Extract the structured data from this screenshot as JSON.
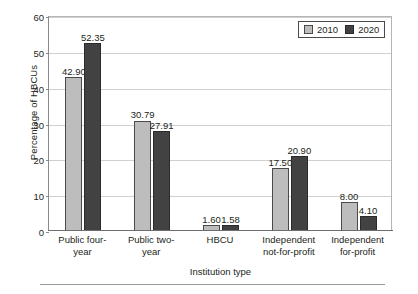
{
  "chart_data": {
    "type": "bar",
    "title": "",
    "xlabel": "Institution type",
    "ylabel": "Percentage of HBCUs",
    "ylim": [
      0,
      60
    ],
    "yticks": [
      0,
      10,
      20,
      30,
      40,
      50,
      60
    ],
    "grid": true,
    "legend_position": "top-right",
    "categories": [
      "Public four-year",
      "Public two-year",
      "HBCU",
      "Independent not-for-profit",
      "Independent for-profit"
    ],
    "category_lines": [
      [
        "Public four-",
        "year"
      ],
      [
        "Public two-",
        "year"
      ],
      [
        "HBCU"
      ],
      [
        "Independent",
        "not-for-profit"
      ],
      [
        "Independent",
        "for-profit"
      ]
    ],
    "series": [
      {
        "name": "2010",
        "color": "#bdbdbd",
        "values": [
          42.9,
          30.79,
          1.6,
          17.5,
          8.0
        ],
        "labels": [
          "42.90",
          "30.79",
          "1.60",
          "17.50",
          "8.00"
        ]
      },
      {
        "name": "2020",
        "color": "#424242",
        "values": [
          52.35,
          27.91,
          1.58,
          20.9,
          4.1
        ],
        "labels": [
          "52.35",
          "27.91",
          "1.58",
          "20.90",
          "4.10"
        ]
      }
    ]
  },
  "axis": {
    "ytick_labels": [
      "0",
      "10",
      "20",
      "30",
      "40",
      "50",
      "60"
    ],
    "ylabel": "Percentage of HBCUs",
    "xlabel": "Institution type"
  },
  "legend": {
    "items": [
      {
        "label": "2010",
        "color": "#bdbdbd"
      },
      {
        "label": "2020",
        "color": "#424242"
      }
    ]
  }
}
